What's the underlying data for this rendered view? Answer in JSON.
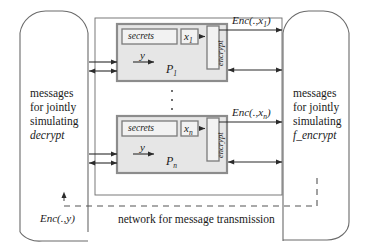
{
  "figure": {
    "colors": {
      "stroke": "#3a3a3a",
      "box_fill": "#e8e8e8",
      "box_border": "#8a8a8a",
      "inner_fill": "#f0f0f0",
      "dashed": "#555555",
      "text": "#1a1a1a"
    }
  },
  "left_capsule": {
    "name": "messages-for-jointly-simulating-decrypt",
    "line1": "messages",
    "line2": "for jointly",
    "line3": "simulating",
    "line4": "decrypt"
  },
  "right_capsule": {
    "name": "messages-for-jointly-simulating-f-encrypt",
    "line1": "messages",
    "line2": "for jointly",
    "line3": "simulating",
    "line4": "f_encrypt"
  },
  "processes": [
    {
      "id": "p1",
      "secrets_label": "secrets",
      "input_label": "x",
      "input_sub": "1",
      "encrypt_label": "encrypt",
      "y_label": "y",
      "process_label": "P",
      "process_sub": "1",
      "output_label": "Enc(.,x",
      "output_sub": "1",
      "output_tail": ")"
    },
    {
      "id": "pn",
      "secrets_label": "secrets",
      "input_label": "x",
      "input_sub": "n",
      "encrypt_label": "encrypt",
      "y_label": "y",
      "process_label": "P",
      "process_sub": "n",
      "output_label": "Enc(.,x",
      "output_sub": "n",
      "output_tail": ")"
    }
  ],
  "ellipsis": {
    "name": "vertical-ellipsis",
    "dots": 3
  },
  "network": {
    "label": "network for message transmission",
    "feedback_label": "Enc(.,y",
    "feedback_tail": ")"
  }
}
